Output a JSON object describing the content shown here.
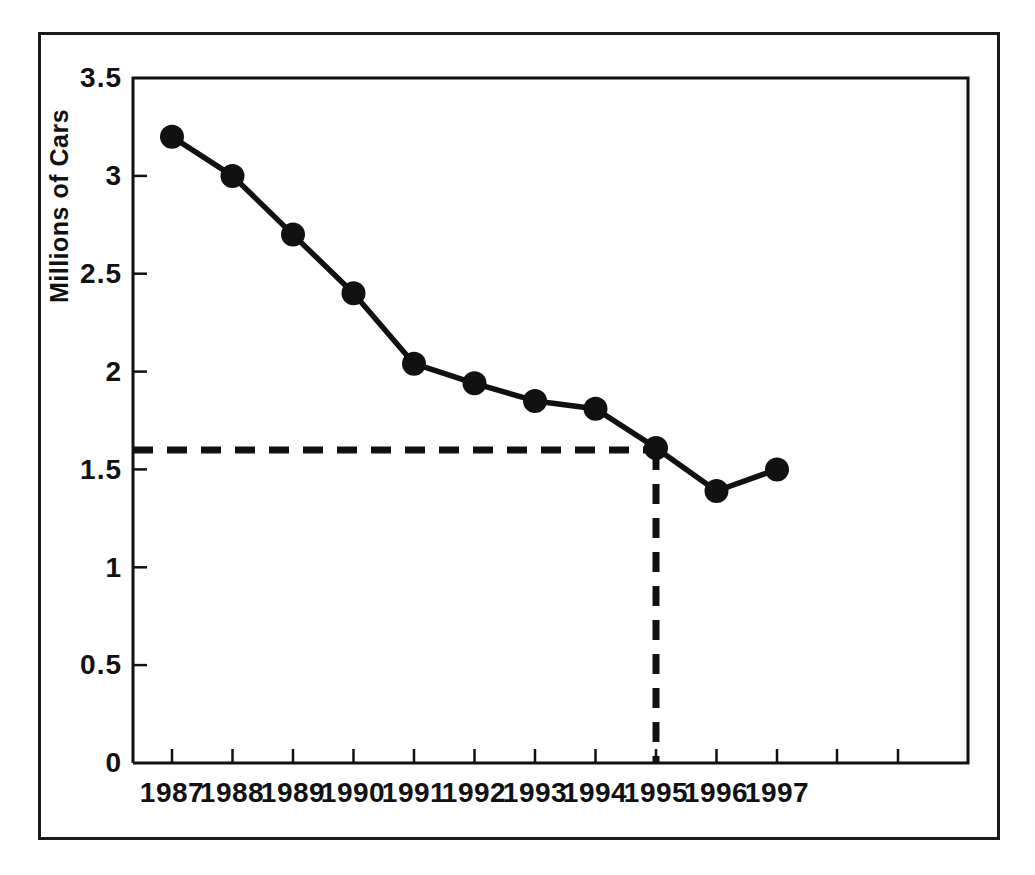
{
  "chart_data": {
    "type": "line",
    "title": "",
    "xlabel": "",
    "ylabel": "Millions of Cars",
    "categories": [
      "1987",
      "1988",
      "1989",
      "1990",
      "1991",
      "1992",
      "1993",
      "1994",
      "1995",
      "1996",
      "1997"
    ],
    "x": [
      1987,
      1988,
      1989,
      1990,
      1991,
      1992,
      1993,
      1994,
      1995,
      1996,
      1997
    ],
    "values": [
      3.2,
      3.0,
      2.7,
      2.4,
      2.04,
      1.94,
      1.85,
      1.81,
      1.61,
      1.39,
      1.5
    ],
    "series": [
      {
        "name": "Millions of Cars",
        "values": [
          3.2,
          3.0,
          2.7,
          2.4,
          2.04,
          1.94,
          1.85,
          1.81,
          1.61,
          1.39,
          1.5
        ]
      }
    ],
    "ylim": [
      0,
      3.5
    ],
    "yticks": [
      0,
      0.5,
      1,
      1.5,
      2,
      2.5,
      3,
      3.5
    ],
    "ytick_labels": [
      "0",
      "0.5",
      "1",
      "1.5",
      "2",
      "2.5",
      "3",
      "3.5"
    ],
    "xtick_labels": [
      "1987",
      "1988",
      "1989",
      "1990",
      "1991",
      "1992",
      "1993",
      "1994",
      "1995",
      "1996",
      "1997"
    ],
    "grid": false,
    "legend": "none",
    "marker": "filled-circle",
    "line_color": "#111111",
    "marker_color": "#111111",
    "annotations": [
      {
        "type": "horizontal-dashed-guide",
        "y": 1.6,
        "label": "",
        "from_x": 1987,
        "to_x": 1995
      },
      {
        "type": "vertical-dashed-guide",
        "x": 1995,
        "label": "",
        "from_y": 0,
        "to_y": 1.6
      }
    ]
  },
  "axes": {
    "y_title": "Millions of Cars",
    "y_labels": [
      "3.5",
      "3",
      "2.5",
      "2",
      "1.5",
      "1",
      "0.5",
      "0"
    ],
    "x_labels": [
      "1987",
      "1988",
      "1989",
      "1990",
      "1991",
      "1992",
      "1993",
      "1994",
      "1995",
      "1996",
      "1997"
    ]
  },
  "colors": {
    "ink": "#111111",
    "frame": "#1a1a1a",
    "background": "#ffffff"
  }
}
